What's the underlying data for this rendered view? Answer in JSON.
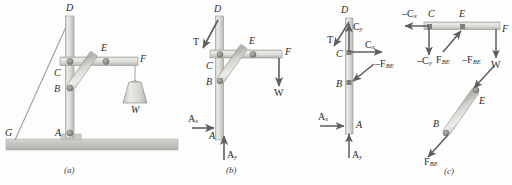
{
  "figure": {
    "background_color": "#fdfdfd",
    "member_fill": "#dcdcd8",
    "member_stroke": "#9a9a96",
    "ground_fill": "#c9c9c6",
    "arrow_color": "#5a5a5a",
    "pin_color": "#8c8c8c",
    "label_color": "#2b2b2b"
  },
  "panels": [
    {
      "id": "a",
      "caption": "(a)",
      "description": "Derrick: vertical mast A-D, horizontal boom C-F, brace B-E, guy cable G-D, hanging weight W",
      "labels": {
        "D": "D",
        "E": "E",
        "F": "F",
        "C": "C",
        "B": "B",
        "A": "A",
        "G": "G",
        "W": "W"
      }
    },
    {
      "id": "b",
      "caption": "(b)",
      "description": "Free-body diagram of entire frame",
      "labels": {
        "D": "D",
        "E": "E",
        "F": "F",
        "C": "C",
        "B": "B",
        "A": "A",
        "T": "T",
        "W": "W",
        "Ax": "A",
        "Ax_sub": "x",
        "Ay": "A",
        "Ay_sub": "y"
      }
    },
    {
      "id": "c",
      "caption": "(c)",
      "description": "Exploded free-body diagrams of mast AD, boom CF, and two-force member BE",
      "labels": {
        "D": "D",
        "C": "C",
        "B": "B",
        "A": "A",
        "E": "E",
        "F": "F",
        "T": "T",
        "W": "W",
        "Cy": "C",
        "Cy_sub": "y",
        "Cx": "C",
        "Cx_sub": "x",
        "negCx": "–C",
        "negCx_sub": "x",
        "negCy": "–C",
        "negCy_sub": "y",
        "negFBE_mast": "–F",
        "negFBE_mast_sub": "BE",
        "FBE_boom": "F",
        "FBE_boom_sub": "BE",
        "negFBE_link": "–F",
        "negFBE_link_sub": "BE",
        "FBE_link": "F",
        "FBE_link_sub": "BE",
        "Ax": "A",
        "Ax_sub": "x",
        "Ay": "A",
        "Ay_sub": "y"
      }
    }
  ]
}
